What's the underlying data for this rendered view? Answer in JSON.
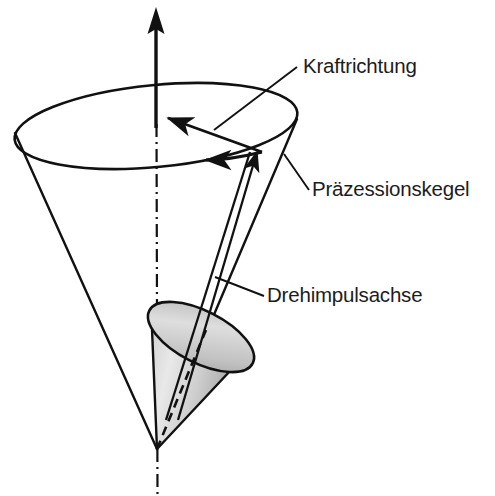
{
  "figure": {
    "title_visible": false,
    "background_color": "#ffffff",
    "stroke_color": "#111111",
    "labels": [
      {
        "id": "kraftrichtung",
        "text": "Kraftrichtung",
        "x": 303,
        "y": 73,
        "leader": {
          "x1": 214,
          "y1": 130,
          "x2": 297,
          "y2": 67
        }
      },
      {
        "id": "praezessionskegel",
        "text": "Präzessionskegel",
        "x": 312,
        "y": 196,
        "leader": {
          "x1": 284,
          "y1": 154,
          "x2": 309,
          "y2": 190
        }
      },
      {
        "id": "drehimpulsachse",
        "text": "Drehimpulsachse",
        "x": 267,
        "y": 302,
        "leader": {
          "x1": 215,
          "y1": 277,
          "x2": 264,
          "y2": 296
        }
      }
    ],
    "geometry": {
      "apex": {
        "x": 157,
        "y": 449
      },
      "precession_cone": {
        "top_ellipse": {
          "cx": 156,
          "cy": 126,
          "rx": 142,
          "ry": 41,
          "rotation": -5.5
        },
        "left_slant": {
          "x1": 15,
          "y1": 132,
          "x2": 157,
          "y2": 449
        },
        "right_slant": {
          "x1": 297,
          "y1": 120,
          "x2": 157,
          "y2": 449
        }
      },
      "vertical_axis": {
        "arrow_tip": {
          "x": 156,
          "y": 8
        },
        "arrow_base": {
          "x": 156,
          "y": 126
        },
        "dash_dot_top": {
          "x": 156,
          "y": 126
        },
        "dash_dot_bottom": {
          "x": 157,
          "y": 496
        }
      },
      "spin_cone": {
        "apex": {
          "x": 157,
          "y": 449
        },
        "base_center": {
          "x": 201,
          "y": 337
        },
        "base_rx": 58,
        "base_ry": 26,
        "base_rotation": 27,
        "fill_light": "#e6e6e6",
        "fill_mid": "#bdbdbd",
        "fill_dark": "#9a9a9a"
      },
      "angular_momentum_arrow": {
        "from": {
          "x": 176,
          "y": 419
        },
        "to": {
          "x": 258,
          "y": 148
        }
      },
      "precession_arrows": [
        {
          "from": {
            "x": 262,
            "y": 152
          },
          "to": {
            "x": 161,
            "y": 116
          }
        },
        {
          "from": {
            "x": 262,
            "y": 152
          },
          "to": {
            "x": 200,
            "y": 160
          }
        }
      ]
    },
    "icons": {
      "axis_arrowhead": "arrow-up-icon",
      "spin_arrowhead": "arrow-upright-icon",
      "precession_arrowhead": "arrow-left-icon"
    }
  }
}
